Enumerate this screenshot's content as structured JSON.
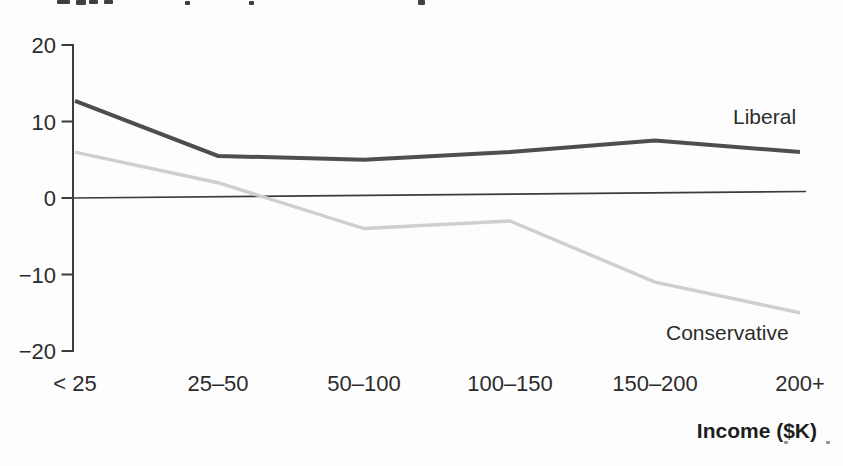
{
  "chart_data": {
    "type": "line",
    "title": "",
    "categories": [
      "< 25",
      "25–50",
      "50–100",
      "100–150",
      "150–200",
      "200+"
    ],
    "series": [
      {
        "name": "Liberal",
        "color": "#4e4e4e",
        "width": 4,
        "values": [
          12.7,
          5.5,
          5,
          6,
          7.5,
          6
        ]
      },
      {
        "name": "Conservative",
        "color": "#cfcfcf",
        "width": 3.5,
        "values": [
          6,
          2,
          -4,
          -3,
          -11,
          -15
        ]
      }
    ],
    "xlabel": "Income ($K)",
    "ylabel": "",
    "ylim": [
      -20,
      20
    ],
    "yticks": [
      20,
      10,
      0,
      -10,
      -20
    ],
    "grid": false,
    "zero_line": true,
    "legend": "inline-series-labels",
    "axis_color": "#3c3c3c",
    "text_color": "#2c2c2c",
    "background": "#fdfdfd"
  }
}
